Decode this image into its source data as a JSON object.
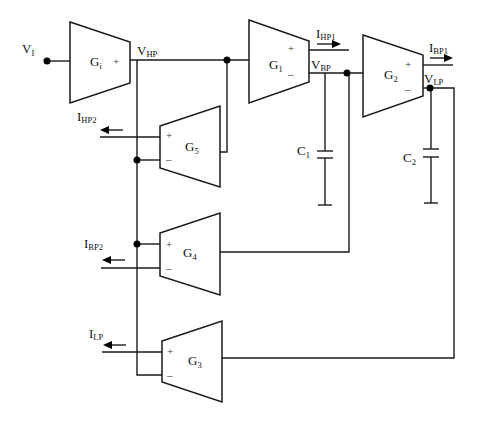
{
  "diagram": {
    "type": "OTA-C biquad filter schematic",
    "blocks": {
      "Gi": {
        "main": "G",
        "sub": "i",
        "sign_out": "+"
      },
      "G1": {
        "main": "G",
        "sub": "1",
        "sign_plus": "+",
        "sign_minus": "–"
      },
      "G2": {
        "main": "G",
        "sub": "2",
        "sign_plus": "+",
        "sign_minus": "–"
      },
      "G3": {
        "main": "G",
        "sub": "3",
        "sign_plus": "+",
        "sign_minus": "–"
      },
      "G4": {
        "main": "G",
        "sub": "4",
        "sign_plus": "+",
        "sign_minus": "–"
      },
      "G5": {
        "main": "G",
        "sub": "5",
        "sign_plus": "+",
        "sign_minus": "–"
      }
    },
    "nodes": {
      "VI": {
        "main": "V",
        "sub": "I"
      },
      "VHP": {
        "main": "V",
        "sub": "HP"
      },
      "VBP": {
        "main": "V",
        "sub": "BP"
      },
      "VLP": {
        "main": "V",
        "sub": "LP"
      }
    },
    "currents": {
      "IHP1": {
        "main": "I",
        "sub": "HP1"
      },
      "IBP1": {
        "main": "I",
        "sub": "BP1"
      },
      "IHP2": {
        "main": "I",
        "sub": "HP2"
      },
      "IBP2": {
        "main": "I",
        "sub": "BP2"
      },
      "ILP": {
        "main": "I",
        "sub": "LP"
      }
    },
    "capacitors": {
      "C1": {
        "main": "C",
        "sub": "1"
      },
      "C2": {
        "main": "C",
        "sub": "2"
      }
    }
  }
}
